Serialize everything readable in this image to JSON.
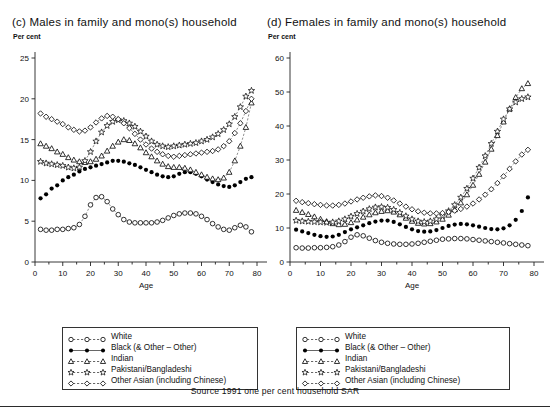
{
  "panels": [
    {
      "id": "c",
      "title": "(c) Males in family and mono(s) household",
      "unit": "Per cent"
    },
    {
      "id": "d",
      "title": "(d) Females in family and mono(s) household",
      "unit": "Per cent"
    }
  ],
  "legend": {
    "entries": [
      {
        "label": "White",
        "marker": "open-circle"
      },
      {
        "label": "Black  (& Other – Other)",
        "marker": "filled-circle"
      },
      {
        "label": "Indian",
        "marker": "open-triangle"
      },
      {
        "label": "Pakistani/Bangladeshi",
        "marker": "open-star"
      },
      {
        "label": "Other Asian (including Chinese)",
        "marker": "open-diamond"
      }
    ]
  },
  "source": "Source 1991 one per cent household SAR",
  "chart_data": [
    {
      "type": "line",
      "id": "c",
      "title": "(c) Males in family and mono(s) household",
      "xlabel": "Age",
      "ylabel": "Per cent",
      "xlim": [
        0,
        80
      ],
      "ylim": [
        0,
        25
      ],
      "xticks": [
        0,
        10,
        20,
        30,
        40,
        50,
        60,
        70,
        80
      ],
      "yticks": [
        0,
        5,
        10,
        15,
        20,
        25
      ],
      "minor_xtick_step": 5,
      "grid": false,
      "legend_position": "below-left",
      "x": [
        2,
        4,
        6,
        8,
        10,
        12,
        14,
        16,
        18,
        20,
        22,
        24,
        26,
        28,
        30,
        32,
        34,
        36,
        38,
        40,
        42,
        44,
        46,
        48,
        50,
        52,
        54,
        56,
        58,
        60,
        62,
        64,
        66,
        68,
        70,
        72,
        74,
        76,
        78
      ],
      "series": [
        {
          "name": "White",
          "marker": "open-circle",
          "values": [
            4.0,
            3.9,
            3.9,
            4.0,
            4.0,
            4.1,
            4.2,
            4.6,
            5.6,
            7.0,
            7.9,
            8.0,
            7.4,
            6.5,
            5.8,
            5.2,
            4.9,
            4.8,
            4.8,
            4.8,
            4.8,
            4.9,
            5.1,
            5.4,
            5.7,
            5.9,
            6.0,
            6.0,
            5.9,
            5.6,
            5.2,
            4.7,
            4.3,
            4.0,
            3.9,
            4.2,
            4.5,
            4.3,
            3.7
          ]
        },
        {
          "name": "Black  (& Other – Other)",
          "marker": "filled-circle",
          "values": [
            7.8,
            8.3,
            9.0,
            9.4,
            10.0,
            10.4,
            10.7,
            11.1,
            11.4,
            11.6,
            11.8,
            12.0,
            12.2,
            12.4,
            12.4,
            12.3,
            12.1,
            11.9,
            11.6,
            11.3,
            11.0,
            10.7,
            10.5,
            10.4,
            10.5,
            10.8,
            11.0,
            11.0,
            10.8,
            10.5,
            10.1,
            9.8,
            9.5,
            9.3,
            9.2,
            9.4,
            9.8,
            10.2,
            10.4
          ]
        },
        {
          "name": "Indian",
          "marker": "open-triangle",
          "values": [
            14.5,
            14.2,
            13.9,
            13.5,
            13.2,
            12.8,
            12.5,
            12.3,
            12.2,
            12.3,
            12.6,
            13.0,
            13.6,
            14.2,
            14.7,
            15.0,
            14.9,
            14.5,
            14.0,
            13.4,
            12.9,
            12.4,
            12.0,
            11.7,
            11.6,
            11.6,
            11.5,
            11.3,
            11.0,
            10.7,
            10.4,
            10.2,
            10.1,
            10.3,
            11.0,
            12.4,
            14.2,
            16.5,
            19.5
          ]
        },
        {
          "name": "Pakistani/Bangladeshi",
          "marker": "open-star",
          "values": [
            12.3,
            12.1,
            12.0,
            11.9,
            11.8,
            11.6,
            11.5,
            11.6,
            12.4,
            13.5,
            14.8,
            15.9,
            16.7,
            17.2,
            17.4,
            17.3,
            17.0,
            16.6,
            16.0,
            15.4,
            14.8,
            14.4,
            14.2,
            14.1,
            14.2,
            14.3,
            14.4,
            14.5,
            14.6,
            14.8,
            15.0,
            15.3,
            15.7,
            16.2,
            16.9,
            17.8,
            19.0,
            20.3,
            21.0
          ]
        },
        {
          "name": "Other Asian (including Chinese)",
          "marker": "open-diamond",
          "values": [
            18.2,
            17.8,
            17.5,
            17.2,
            16.9,
            16.5,
            16.2,
            16.0,
            16.1,
            16.5,
            17.1,
            17.6,
            17.9,
            17.8,
            17.5,
            17.0,
            16.4,
            15.7,
            15.0,
            14.4,
            13.9,
            13.5,
            13.2,
            13.0,
            12.9,
            13.0,
            13.1,
            13.2,
            13.3,
            13.4,
            13.5,
            13.6,
            13.8,
            14.2,
            14.8,
            15.8,
            17.0,
            18.5,
            20.0
          ]
        }
      ]
    },
    {
      "type": "line",
      "id": "d",
      "title": "(d) Females in family and mono(s) household",
      "xlabel": "Age",
      "ylabel": "Per cent",
      "xlim": [
        0,
        80
      ],
      "ylim": [
        0,
        60
      ],
      "xticks": [
        0,
        10,
        20,
        30,
        40,
        50,
        60,
        70,
        80
      ],
      "yticks": [
        0,
        10,
        20,
        30,
        40,
        50,
        60
      ],
      "minor_xtick_step": 5,
      "grid": false,
      "legend_position": "below-right",
      "x": [
        2,
        4,
        6,
        8,
        10,
        12,
        14,
        16,
        18,
        20,
        22,
        24,
        26,
        28,
        30,
        32,
        34,
        36,
        38,
        40,
        42,
        44,
        46,
        48,
        50,
        52,
        54,
        56,
        58,
        60,
        62,
        64,
        66,
        68,
        70,
        72,
        74,
        76,
        78
      ],
      "series": [
        {
          "name": "White",
          "marker": "open-circle",
          "values": [
            4.2,
            4.1,
            4.1,
            4.2,
            4.2,
            4.3,
            4.5,
            5.0,
            6.0,
            7.3,
            8.0,
            7.7,
            7.0,
            6.3,
            5.8,
            5.5,
            5.3,
            5.2,
            5.2,
            5.3,
            5.5,
            5.8,
            6.1,
            6.4,
            6.7,
            6.8,
            6.9,
            6.9,
            6.8,
            6.6,
            6.4,
            6.2,
            6.0,
            5.8,
            5.6,
            5.4,
            5.2,
            5.0,
            4.8
          ]
        },
        {
          "name": "Black  (& Other – Other)",
          "marker": "filled-circle",
          "values": [
            9.5,
            9.0,
            8.5,
            8.0,
            7.6,
            7.4,
            7.5,
            8.0,
            8.8,
            9.6,
            10.2,
            10.8,
            11.4,
            11.9,
            12.2,
            12.2,
            11.8,
            11.1,
            10.3,
            9.6,
            9.1,
            8.9,
            9.0,
            9.4,
            10.0,
            10.6,
            11.0,
            11.2,
            11.1,
            10.8,
            10.4,
            10.0,
            9.7,
            9.6,
            9.9,
            10.8,
            12.4,
            15.0,
            19.0
          ]
        },
        {
          "name": "Indian",
          "marker": "open-triangle",
          "values": [
            15.2,
            14.6,
            14.0,
            13.3,
            12.6,
            11.9,
            11.3,
            11.0,
            11.1,
            11.6,
            12.4,
            13.2,
            13.9,
            14.5,
            14.9,
            15.1,
            14.7,
            13.9,
            12.9,
            12.0,
            11.4,
            11.2,
            11.3,
            11.8,
            12.6,
            13.8,
            15.4,
            17.4,
            19.8,
            22.6,
            25.8,
            29.4,
            33.2,
            37.2,
            41.2,
            45.0,
            48.4,
            51.0,
            52.5
          ]
        },
        {
          "name": "Pakistani/Bangladeshi",
          "marker": "open-star",
          "values": [
            12.2,
            12.0,
            11.9,
            11.8,
            11.7,
            11.6,
            11.7,
            12.0,
            12.6,
            13.4,
            14.2,
            14.9,
            15.6,
            16.1,
            16.2,
            16.0,
            15.4,
            14.5,
            13.5,
            12.6,
            12.0,
            11.8,
            12.0,
            12.6,
            13.6,
            15.0,
            16.8,
            19.0,
            21.6,
            24.6,
            27.8,
            31.2,
            34.8,
            38.4,
            42.0,
            45.0,
            47.0,
            48.0,
            48.5
          ]
        },
        {
          "name": "Other Asian (including Chinese)",
          "marker": "open-diamond",
          "values": [
            18.0,
            17.6,
            17.3,
            17.0,
            16.8,
            16.6,
            16.6,
            16.8,
            17.2,
            17.8,
            18.4,
            18.9,
            19.3,
            19.6,
            19.4,
            18.9,
            18.1,
            17.2,
            16.3,
            15.5,
            14.9,
            14.5,
            14.3,
            14.3,
            14.4,
            14.7,
            15.1,
            15.6,
            16.3,
            17.2,
            18.4,
            19.8,
            21.4,
            23.2,
            25.2,
            27.4,
            29.6,
            31.6,
            33.0
          ]
        }
      ]
    }
  ]
}
